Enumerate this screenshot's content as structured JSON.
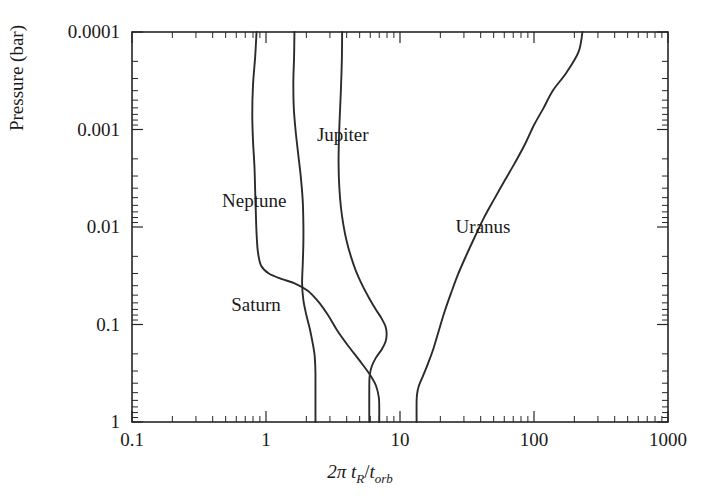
{
  "chart_data": {
    "type": "line",
    "title": "",
    "xlabel": "2π tR/torb",
    "xlabel_parts": {
      "prefix": "2π ",
      "t1": "t",
      "sub1": "R",
      "slash": "/",
      "t2": "t",
      "sub2": "orb"
    },
    "ylabel": "Pressure (bar)",
    "xscale": "log",
    "yscale": "log",
    "y_inverted": true,
    "xlim": [
      0.1,
      1000
    ],
    "ylim": [
      0.0001,
      1
    ],
    "xticks": [
      "0.1",
      "1",
      "10",
      "100",
      "1000"
    ],
    "xtick_values": [
      0.1,
      1,
      10,
      100,
      1000
    ],
    "yticks": [
      "0.0001",
      "0.001",
      "0.01",
      "0.1",
      "1"
    ],
    "ytick_values": [
      0.0001,
      0.001,
      0.01,
      0.1,
      1
    ],
    "grid": false,
    "legend_position": "inline-annotations",
    "line_color": "#2b2b2b",
    "series": [
      {
        "name": "Neptune",
        "label_x": 0.47,
        "label_y": 0.0062,
        "points": [
          [
            0.85,
            0.0001
          ],
          [
            0.83,
            0.00018
          ],
          [
            0.8,
            0.00035
          ],
          [
            0.79,
            0.0007
          ],
          [
            0.8,
            0.0013
          ],
          [
            0.82,
            0.0024
          ],
          [
            0.83,
            0.0042
          ],
          [
            0.84,
            0.0072
          ],
          [
            0.85,
            0.0115
          ],
          [
            0.87,
            0.018
          ],
          [
            0.92,
            0.025
          ],
          [
            1.05,
            0.03
          ],
          [
            1.3,
            0.034
          ],
          [
            1.65,
            0.038
          ],
          [
            2.05,
            0.045
          ],
          [
            2.45,
            0.058
          ],
          [
            2.9,
            0.08
          ],
          [
            3.4,
            0.115
          ],
          [
            4.1,
            0.165
          ],
          [
            5.0,
            0.235
          ],
          [
            5.9,
            0.32
          ],
          [
            6.6,
            0.42
          ],
          [
            6.95,
            0.56
          ],
          [
            7.0,
            0.72
          ],
          [
            7.0,
            1.0
          ]
        ]
      },
      {
        "name": "Saturn",
        "label_x": 0.55,
        "label_y": 0.072,
        "points": [
          [
            1.63,
            0.0001
          ],
          [
            1.62,
            0.00018
          ],
          [
            1.6,
            0.00032
          ],
          [
            1.61,
            0.00058
          ],
          [
            1.66,
            0.001
          ],
          [
            1.74,
            0.0018
          ],
          [
            1.82,
            0.0031
          ],
          [
            1.88,
            0.0054
          ],
          [
            1.9,
            0.009
          ],
          [
            1.9,
            0.015
          ],
          [
            1.88,
            0.024
          ],
          [
            1.86,
            0.038
          ],
          [
            1.9,
            0.056
          ],
          [
            2.0,
            0.08
          ],
          [
            2.12,
            0.11
          ],
          [
            2.22,
            0.15
          ],
          [
            2.3,
            0.2
          ],
          [
            2.33,
            0.26
          ],
          [
            2.34,
            0.33
          ],
          [
            2.34,
            0.43
          ],
          [
            2.34,
            1.0
          ]
        ]
      },
      {
        "name": "Jupiter",
        "label_x": 2.4,
        "label_y": 0.0013,
        "points": [
          [
            3.7,
            0.0001
          ],
          [
            3.68,
            0.0002
          ],
          [
            3.62,
            0.0004
          ],
          [
            3.55,
            0.00075
          ],
          [
            3.5,
            0.0013
          ],
          [
            3.48,
            0.0022
          ],
          [
            3.52,
            0.0038
          ],
          [
            3.62,
            0.0062
          ],
          [
            3.78,
            0.0095
          ],
          [
            4.0,
            0.014
          ],
          [
            4.3,
            0.02
          ],
          [
            4.7,
            0.0285
          ],
          [
            5.25,
            0.04
          ],
          [
            5.9,
            0.054
          ],
          [
            6.6,
            0.07
          ],
          [
            7.3,
            0.087
          ],
          [
            7.8,
            0.105
          ],
          [
            7.95,
            0.125
          ],
          [
            7.8,
            0.15
          ],
          [
            7.3,
            0.18
          ],
          [
            6.6,
            0.22
          ],
          [
            6.15,
            0.27
          ],
          [
            5.95,
            0.33
          ],
          [
            5.9,
            0.42
          ],
          [
            5.9,
            1.0
          ]
        ]
      },
      {
        "name": "Uranus",
        "label_x": 26,
        "label_y": 0.0115,
        "points": [
          [
            230,
            0.0001
          ],
          [
            215,
            0.00016
          ],
          [
            175,
            0.00026
          ],
          [
            138,
            0.0004
          ],
          [
            118,
            0.0006
          ],
          [
            100,
            0.0009
          ],
          [
            86,
            0.0014
          ],
          [
            72,
            0.0022
          ],
          [
            60,
            0.0034
          ],
          [
            50,
            0.0053
          ],
          [
            42,
            0.0082
          ],
          [
            36,
            0.0128
          ],
          [
            31,
            0.02
          ],
          [
            27,
            0.031
          ],
          [
            24,
            0.048
          ],
          [
            21.5,
            0.074
          ],
          [
            19.5,
            0.115
          ],
          [
            17.8,
            0.175
          ],
          [
            16.2,
            0.25
          ],
          [
            14.8,
            0.34
          ],
          [
            13.8,
            0.43
          ],
          [
            13.4,
            0.52
          ],
          [
            13.3,
            0.62
          ],
          [
            13.3,
            1.0
          ]
        ]
      }
    ]
  },
  "labels": {
    "neptune": "Neptune",
    "saturn": "Saturn",
    "jupiter": "Jupiter",
    "uranus": "Uranus"
  },
  "axis": {
    "y_title": "Pressure (bar)",
    "x0": "0.1",
    "x1": "1",
    "x2": "10",
    "x3": "100",
    "x4": "1000",
    "y0": "0.0001",
    "y1": "0.001",
    "y2": "0.01",
    "y3": "0.1",
    "y4": "1",
    "x_prefix": "2π ",
    "x_t1": "t",
    "x_sub1": "R",
    "x_slash": "/",
    "x_t2": "t",
    "x_sub2": "orb"
  }
}
